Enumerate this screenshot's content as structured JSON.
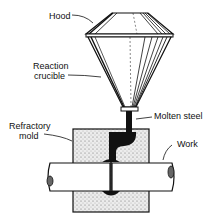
{
  "diagram": {
    "type": "thermite-welding-setup",
    "labels": {
      "hood": "Hood",
      "reaction_crucible_line1": "Reaction",
      "reaction_crucible_line2": "crucible",
      "molten_steel": "Molten steel",
      "refractory_mold_line1": "Refractory",
      "refractory_mold_line2": "mold",
      "work": "Work"
    },
    "colors": {
      "ink": "#111111",
      "background": "#ffffff",
      "mold_fill": "#e6e6e6"
    }
  }
}
